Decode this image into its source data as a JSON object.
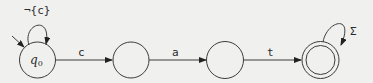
{
  "diagram": {
    "type": "finite-automaton",
    "states": [
      {
        "id": "q0",
        "label": "q",
        "subscript": "0",
        "initial": true,
        "accepting": false
      },
      {
        "id": "s1",
        "label": "",
        "initial": false,
        "accepting": false
      },
      {
        "id": "s2",
        "label": "",
        "initial": false,
        "accepting": false
      },
      {
        "id": "s3",
        "label": "",
        "initial": false,
        "accepting": true
      }
    ],
    "transitions": [
      {
        "from": "q0",
        "to": "q0",
        "label": "¬{c}"
      },
      {
        "from": "q0",
        "to": "s1",
        "label": "c"
      },
      {
        "from": "s1",
        "to": "s2",
        "label": "a"
      },
      {
        "from": "s2",
        "to": "s3",
        "label": "t"
      },
      {
        "from": "s3",
        "to": "s3",
        "label": "Σ"
      }
    ]
  }
}
